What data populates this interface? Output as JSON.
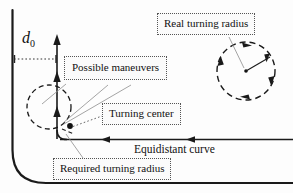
{
  "figure": {
    "title_none": "",
    "labels": {
      "real_turning_radius": "Real turning radius",
      "possible_maneuvers": "Possible maneuvers",
      "turning_center": "Turning center",
      "required_turning_radius": "Required turning radius",
      "equidistant_curve": "Equidistant curve",
      "d0_symbol": "d",
      "d0_subscript": "0"
    },
    "colors": {
      "stroke": "#1a1a1a",
      "leader": "#9a9a9a",
      "box_border": "#555555",
      "background": "#fdfdfd"
    },
    "geometry": {
      "obstacle_curve": "vertical line x=12 from y=10 down to y=150, fillet to horizontal y=183 running right to x=293",
      "equidistant_curve_line": "horizontal y=139 from x=60 to x=293 with left-pointing arrowheads at x=105 and x=190",
      "vertical_path": "x=57 from y=137 up to y=36 with up-arrowheads at y=36, y=75, y=110",
      "required_radius_circle": "dashed circle center (49,107) radius 22",
      "real_radius_circle": "dashed circle center (246,71) radius 29 with radius line to (271,56)",
      "turning_center_dot": "(70,126)",
      "d0_dimension": "dotted horizontal double-tick line y=59 from x=14 to x=56"
    }
  }
}
